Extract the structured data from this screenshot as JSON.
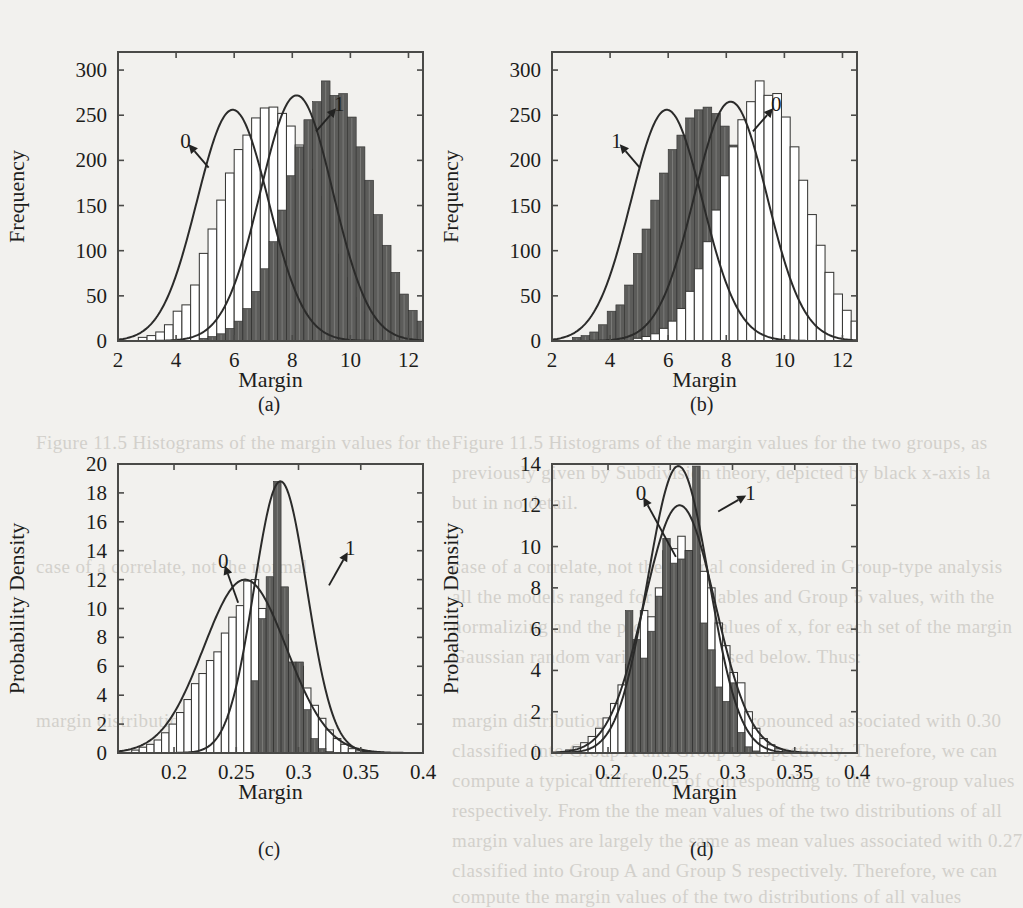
{
  "figure": {
    "background_color": "#f2f1ee",
    "ink_color": "#1d1d1b",
    "class0_fill": "#ffffff",
    "class0_stroke": "#3a3a38",
    "class1_fill": "#5c5c5a",
    "class1_stroke": "#2f2f2e",
    "curve_color": "#2b2b2a"
  },
  "subcaptions": [
    {
      "id": "a",
      "label": "(a)"
    },
    {
      "id": "b",
      "label": "(b)"
    },
    {
      "id": "c",
      "label": "(c)"
    },
    {
      "id": "d",
      "label": "(d)"
    }
  ],
  "ghost_text": [
    {
      "x": 452,
      "y": 432,
      "text": "Figure 11.5  Histograms of the margin values for the two groups, as"
    },
    {
      "x": 452,
      "y": 462,
      "text": "previously given by Subdivision theory, depicted by black x-axis la"
    },
    {
      "x": 452,
      "y": 492,
      "text": "but in no detail."
    },
    {
      "x": 452,
      "y": 556,
      "text": "case of a correlate, not the normal considered in Group-type analysis"
    },
    {
      "x": 452,
      "y": 586,
      "text": "all the models ranged for the variables and Group 5 values, with the"
    },
    {
      "x": 452,
      "y": 616,
      "text": "normalizing and the probability values of x, for each set of the margin"
    },
    {
      "x": 452,
      "y": 646,
      "text": "Gaussian random variance. Discussed below. Thus:"
    },
    {
      "x": 452,
      "y": 710,
      "text": "margin distributions, and so a more pronounced associated with 0.30"
    },
    {
      "x": 452,
      "y": 740,
      "text": "classified into Group A and Group S respectively. Therefore, we can"
    },
    {
      "x": 452,
      "y": 770,
      "text": "compute a typical difference of corresponding to the two-group values"
    },
    {
      "x": 452,
      "y": 800,
      "text": "respectively. From the the mean values of the two distributions of all"
    },
    {
      "x": 452,
      "y": 830,
      "text": "margin values are largely the same as mean values associated with 0.27"
    },
    {
      "x": 452,
      "y": 860,
      "text": "classified into Group A and Group S respectively. Therefore, we can"
    },
    {
      "x": 452,
      "y": 886,
      "text": "compute the margin values of the two distributions of all values"
    },
    {
      "x": 36,
      "y": 432,
      "text": "Figure 11.5  Histograms of the margin values for the"
    },
    {
      "x": 36,
      "y": 556,
      "text": "case of a correlate, not the normal"
    },
    {
      "x": 36,
      "y": 710,
      "text": "margin distributions, and so a"
    }
  ],
  "chart_data": [
    {
      "panel": "a",
      "type": "bar",
      "title": "",
      "xlabel": "Margin",
      "ylabel": "Frequency",
      "xlim": [
        2,
        12.5
      ],
      "ylim": [
        0,
        320
      ],
      "xticks": [
        2,
        4,
        6,
        8,
        10,
        12
      ],
      "xticklabels": [
        "2",
        "4",
        "6",
        "8",
        "10",
        "12"
      ],
      "yticks": [
        0,
        50,
        100,
        150,
        200,
        250,
        300
      ],
      "yticklabels": [
        "0",
        "50",
        "100",
        "150",
        "200",
        "250",
        "300"
      ],
      "grid": false,
      "legend": "annotations",
      "annotations": [
        {
          "text": "0",
          "tx": 4.32,
          "ty": 222,
          "ax": 5.12,
          "ay": 192
        },
        {
          "text": "1",
          "tx": 9.62,
          "ty": 262,
          "ax": 8.82,
          "ay": 232
        }
      ],
      "bin_width": 0.3,
      "series": [
        {
          "name": "0",
          "style": "outline",
          "bin_start": 2.7,
          "values": [
            4,
            6,
            10,
            18,
            33,
            40,
            62,
            97,
            124,
            156,
            186,
            212,
            228,
            247,
            258,
            259,
            252,
            238,
            217,
            190,
            160,
            125,
            96,
            70,
            48,
            32,
            20,
            12,
            7,
            4,
            2,
            1,
            0
          ]
        },
        {
          "name": "1",
          "style": "filled",
          "bin_start": 4.8,
          "values": [
            3,
            5,
            8,
            14,
            22,
            36,
            55,
            80,
            110,
            145,
            183,
            215,
            245,
            265,
            288,
            272,
            274,
            248,
            215,
            178,
            140,
            106,
            76,
            52,
            34,
            22,
            14,
            9,
            6,
            4,
            3,
            2,
            1
          ]
        }
      ],
      "curves": [
        {
          "name": "0",
          "mu": 5.95,
          "sigma": 1.23,
          "peak": 256
        },
        {
          "name": "1",
          "mu": 8.15,
          "sigma": 1.25,
          "peak": 272
        }
      ]
    },
    {
      "panel": "b",
      "type": "bar",
      "title": "",
      "xlabel": "Margin",
      "ylabel": "Frequency",
      "xlim": [
        2,
        12.5
      ],
      "ylim": [
        0,
        320
      ],
      "xticks": [
        2,
        4,
        6,
        8,
        10,
        12
      ],
      "xticklabels": [
        "2",
        "4",
        "6",
        "8",
        "10",
        "12"
      ],
      "yticks": [
        0,
        50,
        100,
        150,
        200,
        250,
        300
      ],
      "yticklabels": [
        "0",
        "50",
        "100",
        "150",
        "200",
        "250",
        "300"
      ],
      "grid": false,
      "legend": "annotations",
      "annotations": [
        {
          "text": "1",
          "tx": 4.22,
          "ty": 222,
          "ax": 5.02,
          "ay": 192
        },
        {
          "text": "0",
          "tx": 9.72,
          "ty": 262,
          "ax": 8.92,
          "ay": 232
        }
      ],
      "bin_width": 0.3,
      "series": [
        {
          "name": "1",
          "style": "filled",
          "bin_start": 2.7,
          "values": [
            4,
            6,
            10,
            18,
            33,
            40,
            62,
            97,
            124,
            156,
            186,
            212,
            228,
            247,
            256,
            259,
            252,
            238,
            217,
            190,
            160,
            125,
            96,
            70,
            48,
            32,
            20,
            12,
            7,
            4,
            2,
            1,
            0
          ]
        },
        {
          "name": "0",
          "style": "outline",
          "bin_start": 4.8,
          "values": [
            3,
            5,
            8,
            14,
            22,
            36,
            55,
            80,
            110,
            145,
            183,
            215,
            245,
            265,
            288,
            272,
            274,
            248,
            215,
            178,
            140,
            106,
            76,
            52,
            34,
            22,
            14,
            9,
            6,
            4,
            3,
            2,
            1
          ]
        }
      ],
      "curves": [
        {
          "name": "1",
          "mu": 5.95,
          "sigma": 1.23,
          "peak": 256
        },
        {
          "name": "0",
          "mu": 8.15,
          "sigma": 1.25,
          "peak": 265
        }
      ]
    },
    {
      "panel": "c",
      "type": "bar",
      "title": "",
      "xlabel": "Margin",
      "ylabel": "Probability Density",
      "xlim": [
        0.155,
        0.4
      ],
      "ylim": [
        0,
        20
      ],
      "xticks": [
        0.2,
        0.25,
        0.3,
        0.35,
        0.4
      ],
      "xticklabels": [
        "0.2",
        "0.25",
        "0.3",
        "0.35",
        "0.4"
      ],
      "yticks": [
        0,
        2,
        4,
        6,
        8,
        10,
        12,
        14,
        16,
        18,
        20
      ],
      "yticklabels": [
        "0",
        "2",
        "4",
        "6",
        "8",
        "10",
        "12",
        "14",
        "16",
        "18",
        "20"
      ],
      "grid": false,
      "legend": "annotations",
      "annotations": [
        {
          "text": "0",
          "tx": 0.2395,
          "ty": 13.3,
          "ax": 0.2515,
          "ay": 10.4
        },
        {
          "text": "1",
          "tx": 0.3415,
          "ty": 14.2,
          "ax": 0.3245,
          "ay": 11.6
        }
      ],
      "bin_width": 0.006,
      "series": [
        {
          "name": "0",
          "style": "outline",
          "bin_start": 0.166,
          "values": [
            0.2,
            0.4,
            0.6,
            0.9,
            1.4,
            2.0,
            2.8,
            3.7,
            4.8,
            5.5,
            6.4,
            7.0,
            8.3,
            9.4,
            10.2,
            11.9,
            12.0,
            10.0,
            9.9,
            9.5,
            8.2,
            6.2,
            6.0,
            4.5,
            3.3,
            2.4,
            1.6,
            1.0,
            0.6,
            0.3,
            0.15,
            0.05
          ]
        },
        {
          "name": "1",
          "style": "filled",
          "bin_start": 0.262,
          "values": [
            5.0,
            9.3,
            12.2,
            18.8,
            11.5,
            6.3,
            6.3,
            3.0,
            1.0,
            0.3,
            0.1
          ]
        }
      ],
      "curves": [
        {
          "name": "0",
          "mu": 0.257,
          "sigma": 0.0333,
          "peak": 12.0
        },
        {
          "name": "1",
          "mu": 0.2855,
          "sigma": 0.0212,
          "peak": 18.8
        }
      ]
    },
    {
      "panel": "d",
      "type": "bar",
      "title": "",
      "xlabel": "Margin",
      "ylabel": "Probability Density",
      "xlim": [
        0.155,
        0.4
      ],
      "ylim": [
        0,
        14
      ],
      "xticks": [
        0.2,
        0.25,
        0.3,
        0.35,
        0.4
      ],
      "xticklabels": [
        "0.2",
        "0.25",
        "0.3",
        "0.35",
        "0.4"
      ],
      "yticks": [
        0,
        2,
        4,
        6,
        8,
        10,
        12,
        14
      ],
      "yticklabels": [
        "0",
        "2",
        "4",
        "6",
        "8",
        "10",
        "12",
        "14"
      ],
      "grid": false,
      "legend": "annotations",
      "annotations": [
        {
          "text": "0",
          "tx": 0.2265,
          "ty": 12.6,
          "ax": 0.2545,
          "ay": 9.5
        },
        {
          "text": "1",
          "tx": 0.3145,
          "ty": 12.6,
          "ax": 0.2885,
          "ay": 11.7
        }
      ],
      "bin_width": 0.006,
      "series": [
        {
          "name": "0",
          "style": "outline",
          "bin_start": 0.166,
          "values": [
            0.15,
            0.3,
            0.5,
            0.8,
            1.2,
            1.7,
            2.4,
            3.3,
            4.3,
            5.4,
            6.9,
            6.6,
            8.0,
            9.8,
            9.9,
            10.5,
            9.8,
            9.6,
            8.8,
            8.0,
            6.3,
            5.2,
            3.9,
            3.4,
            2.0,
            1.2,
            0.7,
            0.4,
            0.2,
            0.1,
            0.05,
            0.02
          ]
        },
        {
          "name": "1",
          "style": "filled",
          "bin_start": 0.214,
          "values": [
            6.9,
            5.5,
            4.6,
            5.9,
            7.6,
            10.4,
            9.2,
            9.4,
            9.8,
            13.9,
            6.3,
            5.0,
            3.2,
            2.5,
            3.4,
            1.0,
            0.3,
            0.1
          ]
        }
      ],
      "curves": [
        {
          "name": "0",
          "mu": 0.2575,
          "sigma": 0.0285,
          "peak": 12.0
        },
        {
          "name": "1",
          "mu": 0.2565,
          "sigma": 0.0246,
          "peak": 13.9
        }
      ]
    }
  ]
}
